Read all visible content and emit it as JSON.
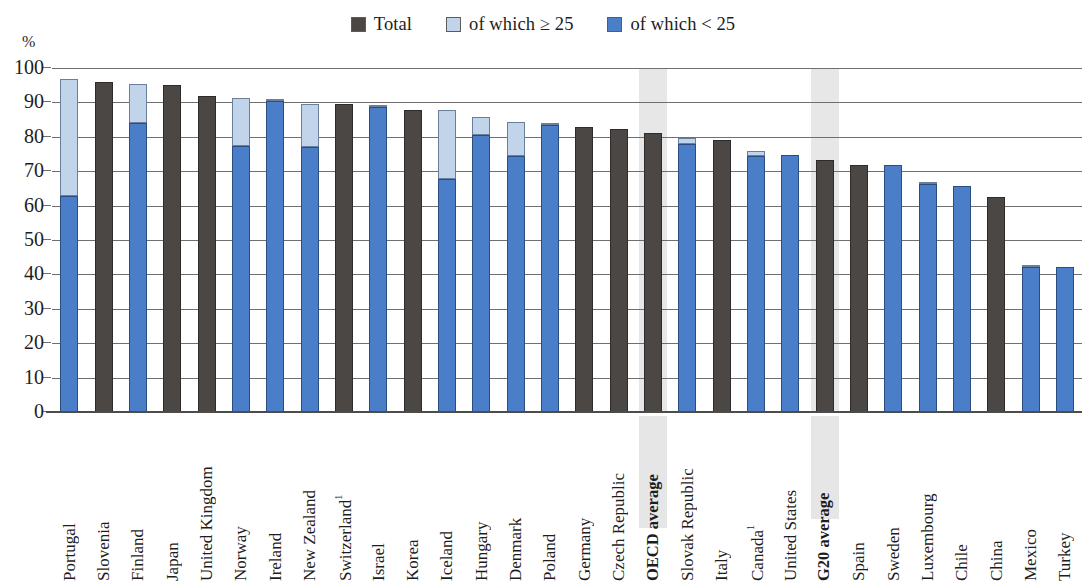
{
  "axis": {
    "unit": "%",
    "yticks": [
      "100",
      "90",
      "80",
      "70",
      "60",
      "50",
      "40",
      "30",
      "20",
      "10",
      "0"
    ]
  },
  "legend": {
    "items": [
      {
        "label": "Total",
        "color": "#4b4745",
        "icon": "legend-swatch-total"
      },
      {
        "label": "of which ≥ 25",
        "color": "#c2d4ea",
        "icon": "legend-swatch-high"
      },
      {
        "label": "of which < 25",
        "color": "#4a7ec9",
        "icon": "legend-swatch-low"
      }
    ]
  },
  "chart_data": {
    "type": "bar",
    "title": "",
    "xlabel": "",
    "ylabel": "%",
    "ylim": [
      0,
      100
    ],
    "ytick_step": 10,
    "grid": true,
    "stacked": true,
    "legend_position": "top-center",
    "colors": {
      "total": "#4b4745",
      "of_which_ge_25": "#c2d4ea",
      "of_which_lt_25": "#4a7ec9"
    },
    "series_names": [
      "Total",
      "of which ≥ 25",
      "of which < 25"
    ],
    "highlighted_categories": [
      "OECD average",
      "G20 average"
    ],
    "footnote_markers": {
      "Switzerland": "1",
      "Canada": "1"
    },
    "categories": [
      "Portugal",
      "Slovenia",
      "Finland",
      "Japan",
      "United Kingdom",
      "Norway",
      "Ireland",
      "New Zealand",
      "Switzerland",
      "Israel",
      "Korea",
      "Iceland",
      "Hungary",
      "Denmark",
      "Poland",
      "Germany",
      "Czech Republic",
      "OECD average",
      "Slovak Republic",
      "Italy",
      "Canada",
      "United States",
      "G20 average",
      "Spain",
      "Sweden",
      "Luxembourg",
      "Chile",
      "China",
      "Mexico",
      "Turkey"
    ],
    "points": [
      {
        "category": "Portugal",
        "total": 96.8,
        "of_which_lt_25": 62.8,
        "of_which_ge_25": 34.0,
        "style": "split"
      },
      {
        "category": "Slovenia",
        "total": 96.0,
        "style": "total"
      },
      {
        "category": "Finland",
        "total": 95.3,
        "of_which_lt_25": 84.0,
        "of_which_ge_25": 11.3,
        "style": "split"
      },
      {
        "category": "Japan",
        "total": 95.0,
        "style": "total"
      },
      {
        "category": "United Kingdom",
        "total": 92.0,
        "style": "total"
      },
      {
        "category": "Norway",
        "total": 91.3,
        "of_which_lt_25": 77.4,
        "of_which_ge_25": 13.9,
        "style": "split"
      },
      {
        "category": "Ireland",
        "total": 91.0,
        "of_which_lt_25": 90.4,
        "of_which_ge_25": 0.6,
        "style": "split"
      },
      {
        "category": "New Zealand",
        "total": 89.6,
        "of_which_lt_25": 76.9,
        "of_which_ge_25": 12.7,
        "style": "split"
      },
      {
        "category": "Switzerland",
        "total": 89.4,
        "style": "total"
      },
      {
        "category": "Israel",
        "total": 89.0,
        "of_which_lt_25": 88.7,
        "of_which_ge_25": 0.3,
        "style": "split"
      },
      {
        "category": "Korea",
        "total": 87.9,
        "style": "total"
      },
      {
        "category": "Iceland",
        "total": 87.8,
        "of_which_lt_25": 67.6,
        "of_which_ge_25": 20.2,
        "style": "split"
      },
      {
        "category": "Hungary",
        "total": 85.9,
        "of_which_lt_25": 80.4,
        "of_which_ge_25": 5.5,
        "style": "split"
      },
      {
        "category": "Denmark",
        "total": 84.4,
        "of_which_lt_25": 74.4,
        "of_which_ge_25": 10.0,
        "style": "split"
      },
      {
        "category": "Poland",
        "total": 84.0,
        "of_which_lt_25": 83.4,
        "of_which_ge_25": 0.6,
        "style": "split"
      },
      {
        "category": "Germany",
        "total": 82.9,
        "style": "total"
      },
      {
        "category": "Czech Republic",
        "total": 82.4,
        "style": "total"
      },
      {
        "category": "OECD average",
        "total": 81.0,
        "style": "total"
      },
      {
        "category": "Slovak Republic",
        "total": 79.6,
        "of_which_lt_25": 77.9,
        "of_which_ge_25": 1.7,
        "style": "split"
      },
      {
        "category": "Italy",
        "total": 79.2,
        "style": "total"
      },
      {
        "category": "Canada",
        "total": 76.0,
        "of_which_lt_25": 74.3,
        "of_which_ge_25": 1.7,
        "style": "split"
      },
      {
        "category": "United States",
        "total": 74.8,
        "of_which_lt_25": 74.8,
        "of_which_ge_25": 0.0,
        "style": "split"
      },
      {
        "category": "G20 average",
        "total": 73.4,
        "style": "total"
      },
      {
        "category": "Spain",
        "total": 71.8,
        "style": "total"
      },
      {
        "category": "Sweden",
        "total": 71.8,
        "of_which_lt_25": 71.8,
        "of_which_ge_25": 0.0,
        "style": "split"
      },
      {
        "category": "Luxembourg",
        "total": 67.0,
        "of_which_lt_25": 66.4,
        "of_which_ge_25": 0.6,
        "style": "split"
      },
      {
        "category": "Chile",
        "total": 65.6,
        "of_which_lt_25": 65.6,
        "of_which_ge_25": 0.0,
        "style": "split"
      },
      {
        "category": "China",
        "total": 62.5,
        "style": "total"
      },
      {
        "category": "Mexico",
        "total": 42.8,
        "of_which_lt_25": 42.3,
        "of_which_ge_25": 0.5,
        "style": "split"
      },
      {
        "category": "Turkey",
        "total": 42.3,
        "of_which_lt_25": 42.3,
        "of_which_ge_25": 0.0,
        "style": "split"
      }
    ]
  }
}
